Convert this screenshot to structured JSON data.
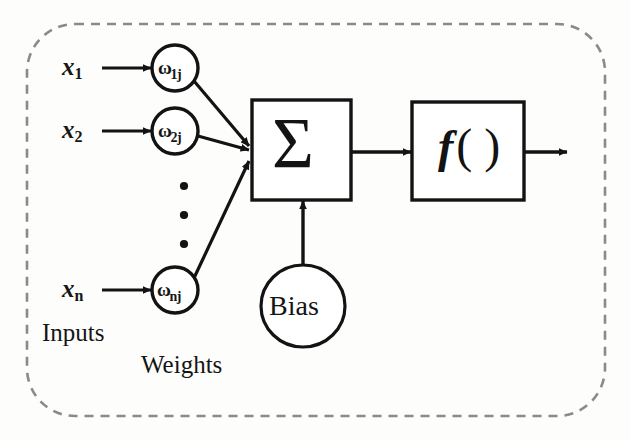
{
  "diagram": {
    "background_color": "#fdfdfc",
    "stroke_color": "#131313",
    "dashed_border_color": "#8a8a8a",
    "inputs": [
      {
        "symbol": "x",
        "subscript": "1"
      },
      {
        "symbol": "x",
        "subscript": "2"
      },
      {
        "symbol": "x",
        "subscript": "n"
      }
    ],
    "weights": [
      {
        "symbol": "ω",
        "subscript": "1j"
      },
      {
        "symbol": "ω",
        "subscript": "2j"
      },
      {
        "symbol": "ω",
        "subscript": "nj"
      }
    ],
    "summation": {
      "symbol": "Σ"
    },
    "activation": {
      "symbol": "f",
      "parens": "( )"
    },
    "bias": {
      "label": "Bias"
    },
    "captions": {
      "inputs": "Inputs",
      "weights": "Weights"
    },
    "ellipsis": {
      "dots": "•••",
      "count": 3
    }
  }
}
